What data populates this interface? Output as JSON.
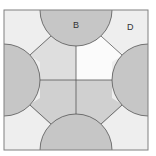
{
  "diagram": {
    "type": "geometry-figure",
    "labels": {
      "top_semicircle": "B",
      "top_right_corner_region": "D"
    },
    "colors": {
      "border": "#808080",
      "line": "#555555",
      "circle_fill": "#c6c6c6",
      "corner_fill": "#eeeeee",
      "inner_upper_left": "#dedede",
      "inner_upper_right": "#fbfbfb",
      "inner_lower_left": "#d0d0d0",
      "inner_lower_right": "#d0d0d0"
    },
    "geometry": {
      "square": {
        "x": 4,
        "y": 10,
        "width": 144,
        "height": 140
      },
      "semicircle_radius": 36,
      "semicircles": [
        {
          "side": "top",
          "cx": 76,
          "cy": 10
        },
        {
          "side": "bottom",
          "cx": 76,
          "cy": 150
        },
        {
          "side": "left",
          "cx": 4,
          "cy": 80
        },
        {
          "side": "right",
          "cx": 148,
          "cy": 80
        }
      ],
      "center": {
        "x": 76,
        "y": 80
      }
    }
  }
}
